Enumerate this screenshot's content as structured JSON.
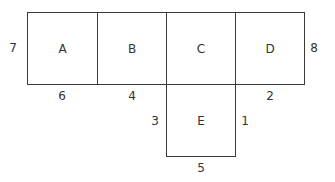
{
  "diagram": {
    "type": "net-of-squares",
    "squares": [
      {
        "id": "A",
        "label": "A"
      },
      {
        "id": "B",
        "label": "B"
      },
      {
        "id": "C",
        "label": "C"
      },
      {
        "id": "D",
        "label": "D"
      },
      {
        "id": "E",
        "label": "E"
      }
    ],
    "edge_labels": {
      "a_left": "7",
      "a_bottom": "6",
      "b_bottom": "4",
      "d_right": "8",
      "d_bottom": "2",
      "e_left": "3",
      "e_right": "1",
      "e_bottom": "5"
    }
  }
}
